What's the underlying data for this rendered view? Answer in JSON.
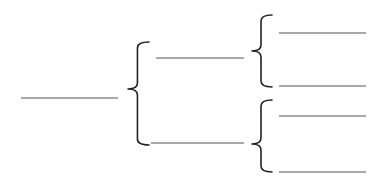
{
  "diagram": {
    "type": "bracket-tree",
    "colors": {
      "background": "#ffffff",
      "line": "#555555",
      "brace": "#222222"
    },
    "root": {
      "line": {
        "x1": 21,
        "x2": 118,
        "y": 98
      },
      "label": ""
    },
    "level1_brace": {
      "x": 128,
      "width": 21,
      "y_top": 42,
      "y_bottom": 145,
      "tip_y": 89
    },
    "branches": [
      {
        "line": {
          "x1": 156,
          "x2": 244,
          "y": 58
        },
        "label": "",
        "brace": {
          "x": 252,
          "width": 20,
          "y_top": 15,
          "y_bottom": 87,
          "tip_y": 51
        },
        "leaves": [
          {
            "line": {
              "x1": 279,
              "x2": 366,
              "y": 33
            },
            "label": ""
          },
          {
            "line": {
              "x1": 279,
              "x2": 366,
              "y": 86
            },
            "label": ""
          }
        ]
      },
      {
        "line": {
          "x1": 151,
          "x2": 244,
          "y": 143
        },
        "label": "",
        "brace": {
          "x": 252,
          "width": 20,
          "y_top": 100,
          "y_bottom": 172,
          "tip_y": 144
        },
        "leaves": [
          {
            "line": {
              "x1": 279,
              "x2": 366,
              "y": 116
            },
            "label": ""
          },
          {
            "line": {
              "x1": 279,
              "x2": 366,
              "y": 172
            },
            "label": ""
          }
        ]
      }
    ]
  }
}
